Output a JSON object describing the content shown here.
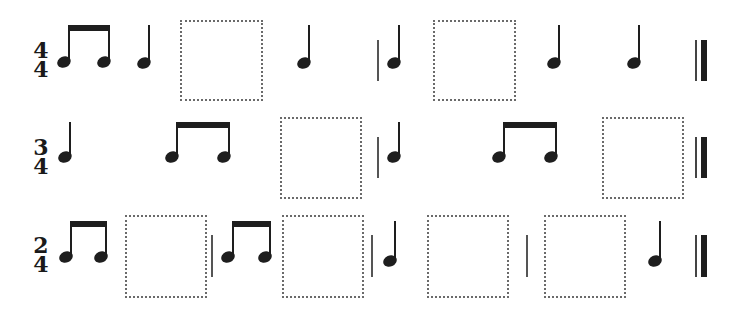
{
  "worksheet": {
    "rows": [
      {
        "time_signature": {
          "top": "4",
          "bottom": "4"
        },
        "sequence": [
          "eighth-pair",
          "quarter",
          "blank",
          "quarter",
          "barline",
          "quarter",
          "blank",
          "quarter",
          "quarter",
          "final-barline"
        ]
      },
      {
        "time_signature": {
          "top": "3",
          "bottom": "4"
        },
        "sequence": [
          "quarter",
          "eighth-pair",
          "blank",
          "barline",
          "quarter",
          "eighth-pair",
          "blank",
          "final-barline"
        ]
      },
      {
        "time_signature": {
          "top": "2",
          "bottom": "4"
        },
        "sequence": [
          "eighth-pair",
          "blank",
          "barline",
          "eighth-pair",
          "blank",
          "barline",
          "quarter",
          "blank",
          "barline",
          "blank",
          "quarter",
          "final-barline"
        ]
      }
    ],
    "colors": {
      "ink": "#1e1e1e",
      "box_border": "#6a6a6a",
      "barline": "#555555",
      "background": "#ffffff"
    }
  }
}
